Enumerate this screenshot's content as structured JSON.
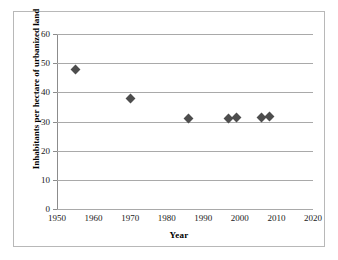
{
  "chart_data": {
    "type": "scatter",
    "title": "",
    "xlabel": "Year",
    "ylabel": "Inhabitants per hectare of urbanized land",
    "xlim": [
      1950,
      2020
    ],
    "ylim": [
      0,
      60
    ],
    "xticks": [
      1950,
      1960,
      1970,
      1980,
      1990,
      2000,
      2010,
      2020
    ],
    "yticks": [
      0,
      10,
      20,
      30,
      40,
      50,
      60
    ],
    "grid": "horizontal",
    "legend": "none",
    "marker": "diamond",
    "marker_color": "#4d4d4d",
    "series": [
      {
        "name": "Inhabitants per hectare of urbanized land",
        "points": [
          {
            "x": 1955,
            "y": 48.0
          },
          {
            "x": 1970,
            "y": 38.0
          },
          {
            "x": 1986,
            "y": 31.1
          },
          {
            "x": 1997,
            "y": 31.0
          },
          {
            "x": 1999,
            "y": 31.3
          },
          {
            "x": 2006,
            "y": 31.4
          },
          {
            "x": 2008,
            "y": 31.6
          }
        ]
      }
    ]
  },
  "axes": {
    "x_title": "Year",
    "y_title": "Inhabitants per hectare of urbanized land",
    "x_tick_labels": [
      "1950",
      "1960",
      "1970",
      "1980",
      "1990",
      "2000",
      "2010",
      "2020"
    ],
    "y_tick_labels": [
      "0",
      "10",
      "20",
      "30",
      "40",
      "50",
      "60"
    ]
  },
  "colors": {
    "marker": "#4d4d4d",
    "gridline": "#a9a9a9",
    "axis": "#8c8c8c",
    "frame": "#b8b8b8",
    "background": "#ffffff"
  }
}
